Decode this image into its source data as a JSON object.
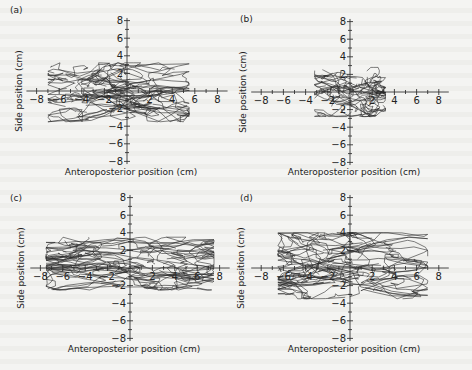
{
  "figure": {
    "panels": [
      "(a)",
      "(b)",
      "(c)",
      "(d)"
    ],
    "xlabel": "Anteroposterior position (cm)",
    "ylabel": "Side position (cm)"
  },
  "chart_data": [
    {
      "type": "line",
      "panel": "(a)",
      "title": "(a)",
      "xlabel": "Anteroposterior position (cm)",
      "ylabel": "Side position (cm)",
      "xlim": [
        -8,
        8
      ],
      "ylim": [
        -8,
        8
      ],
      "x_ticks": [
        -8,
        -6,
        -4,
        -2,
        2,
        4,
        6,
        8
      ],
      "y_ticks": [
        8,
        6,
        4,
        2,
        -2,
        -4,
        -6,
        -8
      ],
      "grid": false,
      "trace_extent": {
        "x": [
          -7.0,
          5.5
        ],
        "y": [
          -3.5,
          3.2
        ]
      },
      "n_traces": 40,
      "seed": 11
    },
    {
      "type": "line",
      "panel": "(b)",
      "title": "(b)",
      "xlabel": "Anteroposterior position (cm)",
      "ylabel": "Side position (cm)",
      "xlim": [
        -8,
        8
      ],
      "ylim": [
        -8,
        8
      ],
      "x_ticks": [
        -8,
        -6,
        -4,
        -2,
        2,
        4,
        6,
        8
      ],
      "y_ticks": [
        8,
        6,
        4,
        2,
        -2,
        -4,
        -6,
        -8
      ],
      "grid": false,
      "trace_extent": {
        "x": [
          -3.2,
          3.2
        ],
        "y": [
          -2.8,
          2.8
        ]
      },
      "n_traces": 30,
      "seed": 23
    },
    {
      "type": "line",
      "panel": "(c)",
      "title": "(c)",
      "xlabel": "Anteroposterior position (cm)",
      "ylabel": "Side position (cm)",
      "xlim": [
        -8,
        8
      ],
      "ylim": [
        -8,
        8
      ],
      "x_ticks": [
        -8,
        -6,
        -4,
        -2,
        2,
        4,
        6,
        8
      ],
      "y_ticks": [
        8,
        6,
        4,
        2,
        -2,
        -4,
        -6,
        -8
      ],
      "grid": false,
      "trace_extent": {
        "x": [
          -7.5,
          7.5
        ],
        "y": [
          -2.5,
          3.5
        ]
      },
      "n_traces": 40,
      "seed": 37
    },
    {
      "type": "line",
      "panel": "(d)",
      "title": "(d)",
      "xlabel": "Anteroposterior position (cm)",
      "ylabel": "Side position (cm)",
      "xlim": [
        -8,
        8
      ],
      "ylim": [
        -8,
        8
      ],
      "x_ticks": [
        -8,
        -6,
        -4,
        -2,
        2,
        4,
        6,
        8
      ],
      "y_ticks": [
        8,
        6,
        4,
        2,
        -2,
        -4,
        -6,
        -8
      ],
      "grid": false,
      "trace_extent": {
        "x": [
          -6.5,
          7.0
        ],
        "y": [
          -3.5,
          4.0
        ]
      },
      "n_traces": 40,
      "seed": 53
    }
  ],
  "layout": {
    "panels": [
      {
        "ox": 127,
        "oy": 91,
        "sx": 11.3,
        "sy": 8.8,
        "label_x": 10,
        "label_y": 13,
        "ylabel_x": 22,
        "xlabel_y": 175
      },
      {
        "ox": 350,
        "oy": 92,
        "sx": 11.1,
        "sy": 8.8,
        "label_x": 240,
        "label_y": 22,
        "ylabel_x": 246,
        "xlabel_y": 175
      },
      {
        "ox": 130,
        "oy": 268,
        "sx": 11.2,
        "sy": 8.8,
        "label_x": 10,
        "label_y": 201,
        "ylabel_x": 24,
        "xlabel_y": 352
      },
      {
        "ox": 350,
        "oy": 268,
        "sx": 11.1,
        "sy": 8.8,
        "label_x": 240,
        "label_y": 201,
        "ylabel_x": 244,
        "xlabel_y": 352
      }
    ]
  }
}
